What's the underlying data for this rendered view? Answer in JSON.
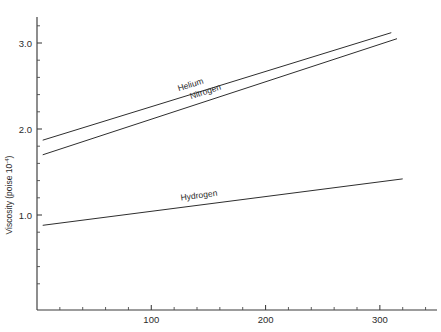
{
  "chart_data": {
    "type": "line",
    "title": "",
    "xlabel": "",
    "ylabel": "Viscosity (poise 10",
    "ylabel_exponent": "-4",
    "ylabel_suffix": ")",
    "xlim": [
      0,
      350
    ],
    "ylim": [
      0,
      3.4
    ],
    "grid": false,
    "legend": "inline-labels",
    "x_ticks_major": [
      100,
      200,
      300
    ],
    "x_tick_labels": [
      "100",
      "200",
      "300"
    ],
    "x_ticks_minor": [
      20,
      40,
      60,
      80,
      120,
      140,
      160,
      180,
      220,
      240,
      260,
      280,
      320,
      340
    ],
    "y_ticks_major": [
      1.0,
      2.0,
      3.0
    ],
    "y_tick_labels": [
      "1.0",
      "2.0",
      "3.0"
    ],
    "y_ticks_minor": [
      0.2,
      0.4,
      0.6,
      0.8,
      1.2,
      1.4,
      1.6,
      1.8,
      2.2,
      2.4,
      2.6,
      2.8,
      3.2
    ],
    "series": [
      {
        "name": "Helium",
        "label": "Helium",
        "x": [
          5,
          310
        ],
        "y": [
          1.87,
          3.12
        ],
        "label_at_x": 135,
        "label_offset": -7
      },
      {
        "name": "Nitrogen",
        "label": "Nitrogen",
        "x": [
          5,
          315
        ],
        "y": [
          1.7,
          3.05
        ],
        "label_at_x": 148,
        "label_offset": -7
      },
      {
        "name": "Hydrogen",
        "label": "Hydrogen",
        "x": [
          5,
          320
        ],
        "y": [
          0.88,
          1.42
        ],
        "label_at_x": 142,
        "label_offset": -7
      }
    ],
    "axis_color": "#3a3a3a",
    "line_color": "#2e2e2e",
    "background": "#ffffff"
  }
}
